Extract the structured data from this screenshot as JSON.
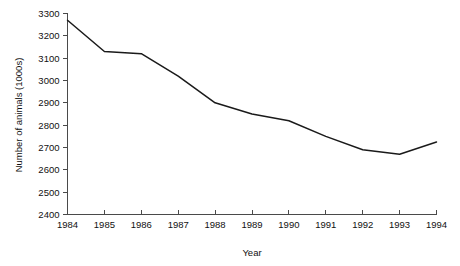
{
  "chart_data": {
    "type": "line",
    "title": "",
    "xlabel": "Year",
    "ylabel": "Number of animals (1000s)",
    "x": [
      1984,
      1985,
      1986,
      1987,
      1988,
      1989,
      1990,
      1991,
      1992,
      1993,
      1994
    ],
    "xtick_labels": [
      "1984",
      "1985",
      "1986",
      "1987",
      "1988",
      "1989",
      "1990",
      "1991",
      "1992",
      "1993",
      "1994"
    ],
    "values": [
      3270,
      3130,
      3120,
      3020,
      2900,
      2850,
      2820,
      2750,
      2690,
      2670,
      2725
    ],
    "ytick_labels": [
      "2400",
      "2500",
      "2600",
      "2700",
      "2800",
      "2900",
      "3000",
      "3100",
      "3200",
      "3300"
    ],
    "yticks": [
      2400,
      2500,
      2600,
      2700,
      2800,
      2900,
      3000,
      3100,
      3200,
      3300
    ],
    "ylim": [
      2400,
      3300
    ],
    "xlim": [
      1984,
      1994
    ],
    "grid": false,
    "legend": "none",
    "series": [
      {
        "name": "Number of animals",
        "color": "#1a1a1a",
        "values": [
          3270,
          3130,
          3120,
          3020,
          2900,
          2850,
          2820,
          2750,
          2690,
          2670,
          2725
        ]
      }
    ]
  },
  "colors": {
    "line": "#1a1a1a",
    "axis": "#4a4a4a",
    "text": "#111111",
    "background": "#ffffff"
  }
}
